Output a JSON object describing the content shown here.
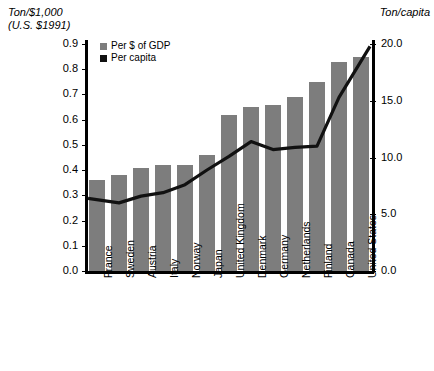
{
  "chart_data": {
    "type": "bar",
    "title": "",
    "left_axis_title": "Ton/$1,000\n(U.S. $1991)",
    "right_axis_title": "Ton/capita",
    "xlabel": "",
    "ylabel": "Ton/$1,000 (U.S. $1991)",
    "ylim": [
      0.0,
      0.9
    ],
    "y2lim": [
      0.0,
      20.0
    ],
    "grid": false,
    "legend_position": "top-left-inside",
    "categories": [
      "France",
      "Sweden",
      "Austria",
      "Italy",
      "Norway",
      "Japan",
      "United Kingdom",
      "Denmark",
      "Germany",
      "Netherlands",
      "Finland",
      "Canada",
      "United States"
    ],
    "left_ticks": [
      "0.0",
      "0.1",
      "0.2",
      "0.3",
      "0.4",
      "0.5",
      "0.6",
      "0.7",
      "0.8",
      "0.9"
    ],
    "left_tick_values": [
      0.0,
      0.1,
      0.2,
      0.3,
      0.4,
      0.5,
      0.6,
      0.7,
      0.8,
      0.9
    ],
    "right_ticks": [
      "0.0",
      "5.0",
      "10.0",
      "15.0",
      "20.0"
    ],
    "right_tick_values": [
      0.0,
      5.0,
      10.0,
      15.0,
      20.0
    ],
    "series": [
      {
        "name": "Per $ of GDP",
        "type": "bar",
        "axis": "left",
        "color": "#7d7d7d",
        "values": [
          0.36,
          0.38,
          0.41,
          0.42,
          0.42,
          0.46,
          0.62,
          0.65,
          0.66,
          0.69,
          0.75,
          0.83,
          0.85
        ]
      },
      {
        "name": "Per capita",
        "type": "line",
        "axis": "right",
        "color": "#111111",
        "values": [
          6.4,
          6.0,
          6.6,
          6.9,
          7.6,
          8.9,
          10.1,
          11.4,
          10.7,
          10.9,
          11.0,
          15.3,
          19.8
        ]
      }
    ]
  },
  "legend": {
    "items": [
      {
        "label": "Per $ of GDP",
        "swatch": "gray"
      },
      {
        "label": "Per capita",
        "swatch": "black"
      }
    ]
  }
}
